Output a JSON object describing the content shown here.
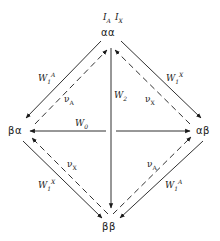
{
  "header": {
    "spin_labels": "I_A  I_X",
    "label_a": "I",
    "sub_a": "A",
    "label_x": "I",
    "sub_x": "X"
  },
  "nodes": {
    "top": "αα",
    "left": "βα",
    "right": "αβ",
    "bottom": "ββ"
  },
  "transitions": {
    "w1a_top_left": {
      "base": "W",
      "sub": "1",
      "sup": "A"
    },
    "w1x_top_right": {
      "base": "W",
      "sub": "1",
      "sup": "X"
    },
    "w1x_bottom_left": {
      "base": "W",
      "sub": "1",
      "sup": "X"
    },
    "w1a_bottom_right": {
      "base": "W",
      "sub": "1",
      "sup": "A"
    },
    "w2": {
      "base": "W",
      "sub": "2"
    },
    "w0": {
      "base": "W",
      "sub": "0"
    },
    "va_upper_left": {
      "base": "ν",
      "sub": "A"
    },
    "vx_upper_right": {
      "base": "ν",
      "sub": "X"
    },
    "vx_lower_left": {
      "base": "ν",
      "sub": "X"
    },
    "va_lower_right": {
      "base": "ν",
      "sub": "A"
    }
  },
  "colors": {
    "line": "#1a1a1a",
    "background": "#ffffff"
  }
}
